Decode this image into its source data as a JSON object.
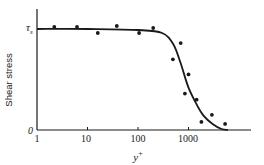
{
  "chart_data": {
    "type": "scatter",
    "title": "",
    "xlabel": "y+",
    "ylabel": "Shear stress",
    "xscale": "log",
    "xlim": [
      1,
      10000
    ],
    "ylim": [
      0,
      1.1
    ],
    "x_ticks": [
      "1",
      "10",
      "100",
      "1000"
    ],
    "y_ticks": [
      "0",
      "τs"
    ],
    "grid": false,
    "legend": null,
    "series": [
      {
        "name": "measured",
        "kind": "points",
        "x": [
          2.2,
          6.2,
          16,
          38,
          105,
          200,
          490,
          700,
          1000,
          850,
          1450,
          1800,
          2900,
          5300
        ],
        "y": [
          1.02,
          1.02,
          0.96,
          1.03,
          0.96,
          1.01,
          0.7,
          0.86,
          0.55,
          0.36,
          0.3,
          0.08,
          0.15,
          0.06
        ]
      },
      {
        "name": "fitted curve",
        "kind": "line",
        "x": [
          1,
          10,
          100,
          300,
          500,
          700,
          1000,
          1500,
          2000,
          3000,
          4500,
          6000
        ],
        "y": [
          1.0,
          1.0,
          0.99,
          0.96,
          0.85,
          0.66,
          0.42,
          0.24,
          0.14,
          0.06,
          0.01,
          0.0
        ]
      }
    ]
  },
  "labels": {
    "ylabel": "Shear stress",
    "xlabel_base": "y",
    "xlabel_sup": "+",
    "tau": "τ",
    "tau_sub": "s",
    "zero": "0",
    "ticks": [
      "1",
      "10",
      "100",
      "1000"
    ]
  }
}
